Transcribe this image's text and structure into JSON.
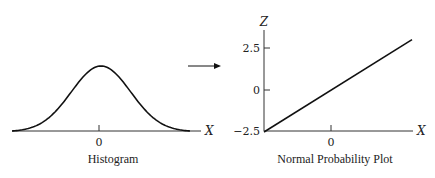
{
  "chart_data": [
    {
      "type": "line",
      "title": "Histogram",
      "xlabel": "X",
      "ylabel": "",
      "x_ticks": [
        "0"
      ],
      "series": [
        {
          "name": "normal-density",
          "shape": "bell-curve",
          "mean": 0,
          "x_range_sd": [
            -3,
            3
          ]
        }
      ]
    },
    {
      "type": "line",
      "title": "Normal Probability Plot",
      "xlabel": "X",
      "ylabel": "Z",
      "x_ticks": [
        "0"
      ],
      "y_ticks": [
        "2.5",
        "0",
        "−2.5"
      ],
      "ylim": [
        -2.5,
        3.2
      ],
      "series": [
        {
          "name": "normal-probability-line",
          "points": [
            {
              "x": -3,
              "z": -2.5
            },
            {
              "x": 3,
              "z": 3.0
            }
          ]
        }
      ]
    }
  ],
  "arrow": {
    "direction": "right",
    "meaning": "transforms-to"
  },
  "left": {
    "caption": "Histogram",
    "x_label": "X",
    "x_tick": "0"
  },
  "right": {
    "caption": "Normal Probability Plot",
    "x_label": "X",
    "y_label": "Z",
    "x_tick": "0",
    "y_ticks": [
      "2.5",
      "0",
      "−2.5"
    ]
  }
}
